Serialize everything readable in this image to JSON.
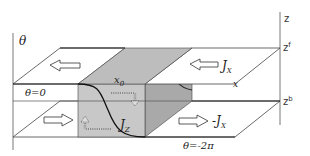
{
  "diagram": {
    "type": "3d-schematic",
    "colors": {
      "line": "#333333",
      "box_front": "#c8c8c8",
      "box_top": "#bdbdbd",
      "box_side": "#a9a9a9",
      "plane": "#ffffff",
      "background": "#ffffff"
    },
    "axes": {
      "left_axis_label": "θ",
      "right_axis_label": "z",
      "top_plane_label": "z",
      "top_plane_sup": "f",
      "bottom_plane_label": "z",
      "bottom_plane_sup": "b"
    },
    "labels": {
      "theta_zero": "θ=0",
      "theta_minus_two_pi": "θ=-2π",
      "x0": "x",
      "x0_sub": "0",
      "x_axis": "x",
      "jx_top": "J",
      "jx_top_sub": "X",
      "jx_bottom": "-J",
      "jx_bottom_sub": "X",
      "jz": "J",
      "jz_sub": "Z"
    },
    "arrows": [
      {
        "id": "top-plane-left-arrow",
        "direction": "left",
        "plane": "top"
      },
      {
        "id": "top-plane-right-arrow",
        "direction": "left",
        "plane": "top"
      },
      {
        "id": "bottom-plane-left-arrow",
        "direction": "right",
        "plane": "bottom"
      },
      {
        "id": "bottom-plane-right-arrow",
        "direction": "right",
        "plane": "bottom"
      },
      {
        "id": "dotted-arrow-top",
        "direction": "right-then-down",
        "style": "dotted"
      },
      {
        "id": "dotted-arrow-bottom",
        "direction": "left-then-up",
        "style": "dotted"
      }
    ]
  }
}
